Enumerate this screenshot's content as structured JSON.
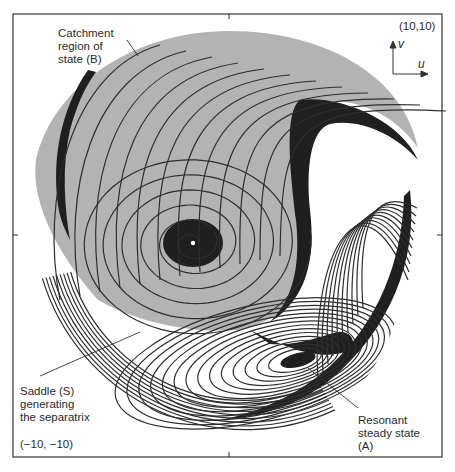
{
  "figure": {
    "type": "phase-portrait",
    "axes": {
      "x_var": "u",
      "y_var": "v"
    },
    "corner_labels": {
      "top_right": "(10,10)",
      "bottom_left": "(−10, −10)"
    },
    "annotations": {
      "catchment": [
        "Catchment",
        "region of",
        "state (B)"
      ],
      "saddle": [
        "Saddle (S)",
        "generating",
        "the separatrix"
      ],
      "resonant": [
        "Resonant",
        "steady state",
        "(A)"
      ]
    },
    "colors": {
      "catchment_fill": "#b3b3b3",
      "separatrix_band": "#1f1f1f",
      "trajectory": "#2e2e2e",
      "frame": "#333333",
      "background": "#ffffff"
    },
    "states": [
      {
        "name": "B",
        "kind": "focus",
        "description": "non-resonant steady state (white dot at spiral center)"
      },
      {
        "name": "A",
        "kind": "focus",
        "description": "resonant steady state"
      },
      {
        "name": "S",
        "kind": "saddle",
        "description": "saddle generating the separatrix"
      }
    ]
  },
  "caption_fragment": "The cut-off caption line below the figure is illegible (only tops of glyphs visible)."
}
